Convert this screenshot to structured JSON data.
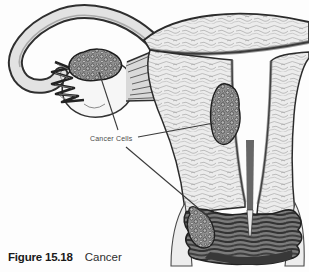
{
  "figure": {
    "annotation_label": "Cancer Cells",
    "caption": {
      "number": "Figure 15.18",
      "title": "Cancer"
    }
  },
  "illustration": {
    "subject_icons": [
      "fallopian-tube-icon",
      "fimbriae-icon",
      "ovary-icon",
      "ovarian-tumor-icon",
      "ovarian-ligament-icon",
      "uterus-fundus-icon",
      "uterus-wall-icon",
      "endometrial-tumor-icon",
      "cervix-icon",
      "cervical-tumor-icon",
      "leader-line-icon"
    ]
  },
  "colors": {
    "paper": "#fdfdfd",
    "ink": "#2b2b2b",
    "tissue_fill": "#ececec",
    "tumor_fill": "#8f8f8f",
    "cervix_fill": "#7b7b7b",
    "leader_line": "#3a3a3a"
  }
}
